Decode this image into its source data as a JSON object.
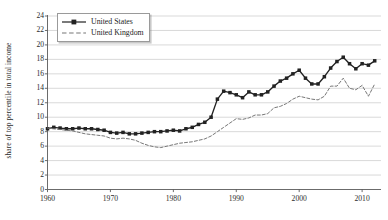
{
  "chart_data": {
    "type": "line",
    "title": "",
    "subtitle": "",
    "xlabel": "",
    "ylabel": "share of top percentile in total income",
    "xlim": [
      1960,
      2013
    ],
    "ylim": [
      0,
      24
    ],
    "grid": true,
    "grid_axis": "y",
    "legend_position": "top-left",
    "xticks": [
      1960,
      1970,
      1980,
      1990,
      2000,
      2010
    ],
    "xtick_labels": [
      "1960",
      "1970",
      "1980",
      "1990",
      "2000",
      "2010"
    ],
    "yticks": [
      0,
      2,
      4,
      6,
      8,
      10,
      12,
      14,
      16,
      18,
      20,
      22,
      24
    ],
    "ytick_labels": [
      "0",
      "2",
      "4",
      "6",
      "8",
      "10",
      "12",
      "14",
      "16",
      "18",
      "20",
      "22",
      "24"
    ],
    "series": [
      {
        "name": "United States",
        "style": "solid",
        "marker": "square",
        "color": "#222222",
        "x": [
          1960,
          1961,
          1962,
          1963,
          1964,
          1965,
          1966,
          1967,
          1968,
          1969,
          1970,
          1971,
          1972,
          1973,
          1974,
          1975,
          1976,
          1977,
          1978,
          1979,
          1980,
          1981,
          1982,
          1983,
          1984,
          1985,
          1986,
          1987,
          1988,
          1989,
          1990,
          1991,
          1992,
          1993,
          1994,
          1995,
          1996,
          1997,
          1998,
          1999,
          2000,
          2001,
          2002,
          2003,
          2004,
          2005,
          2006,
          2007,
          2008,
          2009,
          2010,
          2011,
          2012
        ],
        "values": [
          8.4,
          8.6,
          8.5,
          8.4,
          8.4,
          8.5,
          8.4,
          8.4,
          8.3,
          8.2,
          7.9,
          7.8,
          7.9,
          7.7,
          7.7,
          7.8,
          7.9,
          8.0,
          8.0,
          8.1,
          8.2,
          8.1,
          8.4,
          8.6,
          9.0,
          9.3,
          10.0,
          12.5,
          13.6,
          13.4,
          13.1,
          12.7,
          13.5,
          13.1,
          13.1,
          13.5,
          14.3,
          15.0,
          15.4,
          16.0,
          16.5,
          15.4,
          14.6,
          14.6,
          15.6,
          16.8,
          17.7,
          18.3,
          17.4,
          16.7,
          17.4,
          17.2,
          17.8
        ],
        "y_range_note": "share of total income, percent"
      },
      {
        "name": "United Kingdom",
        "style": "dashed",
        "marker": "none",
        "color": "#777777",
        "x": [
          1960,
          1961,
          1962,
          1963,
          1964,
          1965,
          1966,
          1967,
          1968,
          1969,
          1970,
          1971,
          1972,
          1973,
          1974,
          1975,
          1976,
          1977,
          1978,
          1979,
          1980,
          1981,
          1982,
          1983,
          1984,
          1985,
          1986,
          1987,
          1988,
          1989,
          1990,
          1991,
          1992,
          1993,
          1994,
          1995,
          1996,
          1997,
          1998,
          1999,
          2000,
          2001,
          2002,
          2003,
          2004,
          2005,
          2006,
          2007,
          2008,
          2009,
          2010,
          2011,
          2012
        ],
        "values": [
          8.5,
          8.4,
          8.3,
          8.2,
          8.1,
          7.9,
          7.7,
          7.6,
          7.5,
          7.4,
          7.1,
          7.0,
          7.1,
          7.0,
          6.8,
          6.4,
          6.1,
          5.9,
          5.8,
          6.0,
          6.2,
          6.4,
          6.5,
          6.6,
          6.8,
          7.0,
          7.4,
          8.0,
          8.6,
          9.2,
          9.8,
          9.7,
          9.9,
          10.3,
          10.3,
          10.5,
          11.3,
          11.5,
          11.9,
          12.5,
          12.9,
          12.7,
          12.5,
          12.4,
          12.9,
          14.3,
          14.3,
          15.4,
          14.0,
          13.8,
          14.4,
          12.9,
          14.6
        ],
        "y_range_note": "share of total income, percent"
      }
    ]
  },
  "legend": {
    "items": [
      {
        "label": "United States"
      },
      {
        "label": "United Kingdom"
      }
    ]
  },
  "icons": {
    "legend_key_us": "solid-line-with-square-marker-icon",
    "legend_key_uk": "dashed-line-icon"
  },
  "colors": {
    "us_line": "#222222",
    "uk_line": "#777777",
    "grid": "#c9c9c9",
    "axis": "#5a5a5a",
    "background": "#ffffff",
    "text": "#2b2b2b"
  }
}
